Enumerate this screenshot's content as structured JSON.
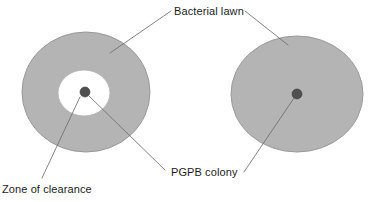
{
  "figure": {
    "width": 381,
    "height": 202,
    "background_color": "#ffffff",
    "type": "scientific-illustration"
  },
  "colors": {
    "bacterial_lawn": "#b4b4b4",
    "zone_of_clearance": "#ffffff",
    "pgpb_colony": "#4f4f4f",
    "outline": "#9a9a9a",
    "leader_line": "#6e6e6e",
    "label_text": "#1c1c1c"
  },
  "labels": {
    "bacterial_lawn": "Bacterial lawn",
    "pgpb_colony": "PGPB colony",
    "zone_of_clearance": "Zone of clearance"
  },
  "plates": [
    {
      "id": "left-plate",
      "name": "plate-with-clearance",
      "lawn": {
        "cx": 86,
        "cy": 92,
        "rx": 64,
        "ry": 60
      },
      "clearance": {
        "cx": 84,
        "cy": 93,
        "rx": 26,
        "ry": 23
      },
      "colony": {
        "cx": 85,
        "cy": 92,
        "r": 5
      },
      "has_zone_of_clearance": true
    },
    {
      "id": "right-plate",
      "name": "plate-without-clearance",
      "lawn": {
        "cx": 297,
        "cy": 94,
        "rx": 66,
        "ry": 58
      },
      "clearance": null,
      "colony": {
        "cx": 297,
        "cy": 94,
        "r": 5
      },
      "has_zone_of_clearance": false
    }
  ],
  "leader_lines": [
    {
      "name": "bacterial-lawn-to-left-plate",
      "x1": 171,
      "y1": 11,
      "x2": 110,
      "y2": 53
    },
    {
      "name": "bacterial-lawn-to-right-plate",
      "x1": 245,
      "y1": 11,
      "x2": 288,
      "y2": 45
    },
    {
      "name": "zone-of-clearance-to-left-plate",
      "x1": 42,
      "y1": 178,
      "x2": 80,
      "y2": 97
    },
    {
      "name": "pgpb-colony-to-left-colony",
      "x1": 165,
      "y1": 170,
      "x2": 89,
      "y2": 96
    },
    {
      "name": "pgpb-colony-to-right-colony",
      "x1": 244,
      "y1": 172,
      "x2": 294,
      "y2": 98
    }
  ]
}
